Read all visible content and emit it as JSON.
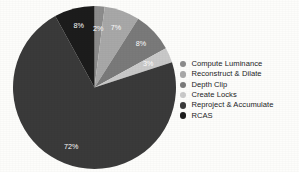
{
  "chart_data": {
    "type": "pie",
    "title": "",
    "labels": [
      "Compute Luminance",
      "Reconstruct & Dilate",
      "Depth Clip",
      "Create Locks",
      "Reproject & Accumulate",
      "RCAS"
    ],
    "values": [
      2,
      7,
      8,
      3,
      72,
      8
    ],
    "value_labels": [
      "2%",
      "7%",
      "8%",
      "3%",
      "72%",
      "8%"
    ],
    "colors": [
      "#8c8c8c",
      "#a8a8a8",
      "#7a7a7a",
      "#c9c9c9",
      "#3a3a3a",
      "#1c1c1c"
    ],
    "legend_position": "right",
    "grid": false,
    "start_angle_deg": 90,
    "direction": "clockwise",
    "background_color": "#fdfdfb",
    "label_text_color": "#ffffff"
  },
  "legend": {
    "items": [
      {
        "label": "Compute Luminance",
        "color": "#8c8c8c"
      },
      {
        "label": "Reconstruct & Dilate",
        "color": "#a8a8a8"
      },
      {
        "label": "Depth Clip",
        "color": "#7a7a7a"
      },
      {
        "label": "Create Locks",
        "color": "#c9c9c9"
      },
      {
        "label": "Reproject & Accumulate",
        "color": "#3a3a3a"
      },
      {
        "label": "RCAS",
        "color": "#1c1c1c"
      }
    ]
  }
}
